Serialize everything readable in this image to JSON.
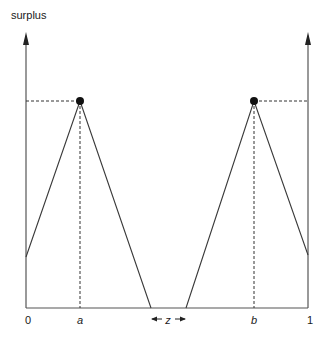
{
  "diagram": {
    "y_axis_label": "surplus",
    "x_axis": {
      "ticks": [
        {
          "label": "0",
          "x": 28
        },
        {
          "label": "a",
          "x": 80
        },
        {
          "label": "z",
          "x": 168
        },
        {
          "label": "b",
          "x": 254
        },
        {
          "label": "1",
          "x": 309
        }
      ],
      "gap_label": "z"
    },
    "tick_labels": {
      "zero": "0",
      "a": "a",
      "b": "b",
      "one": "1",
      "z": "z"
    },
    "peaks": [
      {
        "name": "a",
        "x": 80,
        "y": 101
      },
      {
        "name": "b",
        "x": 254,
        "y": 101
      }
    ],
    "colors": {
      "line": "#3a3a3a",
      "dot": "#111111",
      "text": "#1a1a1a"
    }
  }
}
